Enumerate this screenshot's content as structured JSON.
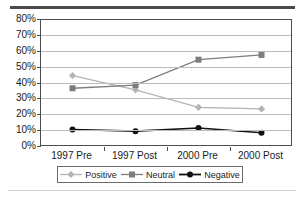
{
  "figure": {
    "clipped_heading": "Graph 1: Responses",
    "top_rule": "horizontal-rule",
    "bottom_rule": "horizontal-rule"
  },
  "chart_data": {
    "type": "line",
    "title": "",
    "xlabel": "",
    "ylabel": "",
    "categories": [
      "1997 Pre",
      "1997 Post",
      "2000 Pre",
      "2000 Post"
    ],
    "ylim": [
      0,
      80
    ],
    "ytick_step": 10,
    "ytick_labels": [
      "0%",
      "10%",
      "20%",
      "30%",
      "40%",
      "50%",
      "60%",
      "70%",
      "80%"
    ],
    "ytick_values": [
      0,
      10,
      20,
      30,
      40,
      50,
      60,
      70,
      80
    ],
    "grid": true,
    "grid_axis": "y",
    "legend_position": "bottom",
    "series": [
      {
        "name": "Positive",
        "values": [
          45,
          36,
          25,
          24
        ],
        "color": "#b4b4b4",
        "marker": "diamond"
      },
      {
        "name": "Neutral",
        "values": [
          37,
          39,
          55,
          58
        ],
        "color": "#7d7d7d",
        "marker": "square"
      },
      {
        "name": "Negative",
        "values": [
          11,
          10,
          12,
          9
        ],
        "color": "#111111",
        "marker": "circle"
      }
    ]
  }
}
